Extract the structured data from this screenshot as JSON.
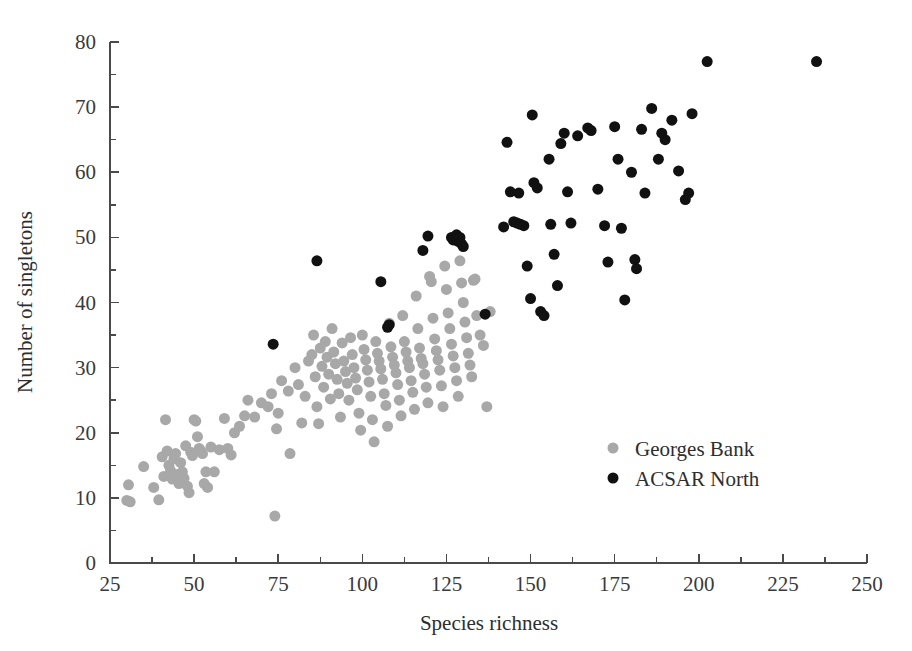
{
  "chart_data": {
    "type": "scatter",
    "title": "",
    "xlabel": "Species richness",
    "ylabel": "Number of singletons",
    "xlim": [
      25,
      250
    ],
    "ylim": [
      0,
      80
    ],
    "xticks": [
      25,
      50,
      75,
      100,
      125,
      150,
      175,
      200,
      225,
      250
    ],
    "xticklabels": [
      "25",
      "50",
      "75",
      "100",
      "125",
      "150",
      "175",
      "200",
      "225",
      "250"
    ],
    "yticks": [
      0,
      10,
      20,
      30,
      40,
      50,
      60,
      70,
      80
    ],
    "yticklabels": [
      "0",
      "10",
      "20",
      "30",
      "40",
      "50",
      "60",
      "70",
      "80"
    ],
    "x_minor_step": 12.5,
    "y_minor_step": 5,
    "grid": false,
    "legend_position": "center-right",
    "marker_size_px": 11,
    "series": [
      {
        "name": "Georges Bank",
        "color": "#a8a8a8",
        "points": [
          [
            30.5,
            12.0
          ],
          [
            30.0,
            9.6
          ],
          [
            31.0,
            9.4
          ],
          [
            35.0,
            14.8
          ],
          [
            38.0,
            11.6
          ],
          [
            39.5,
            9.7
          ],
          [
            40.5,
            16.3
          ],
          [
            41.0,
            13.3
          ],
          [
            41.5,
            22.0
          ],
          [
            42.0,
            17.2
          ],
          [
            42.5,
            15.0
          ],
          [
            43.0,
            14.2
          ],
          [
            43.5,
            12.9
          ],
          [
            44.0,
            16.0
          ],
          [
            44.5,
            16.8
          ],
          [
            45.0,
            13.6
          ],
          [
            45.5,
            12.2
          ],
          [
            46.0,
            15.4
          ],
          [
            46.5,
            14.0
          ],
          [
            47.0,
            13.0
          ],
          [
            47.5,
            18.0
          ],
          [
            48.0,
            11.8
          ],
          [
            48.5,
            10.8
          ],
          [
            49.0,
            17.0
          ],
          [
            49.5,
            16.5
          ],
          [
            50.0,
            22.0
          ],
          [
            50.5,
            21.8
          ],
          [
            51.0,
            19.4
          ],
          [
            51.5,
            17.6
          ],
          [
            52.0,
            17.2
          ],
          [
            52.5,
            16.8
          ],
          [
            53.0,
            12.2
          ],
          [
            53.5,
            14.0
          ],
          [
            54.0,
            11.6
          ],
          [
            55.0,
            17.8
          ],
          [
            56.0,
            14.0
          ],
          [
            57.5,
            17.4
          ],
          [
            59.0,
            22.2
          ],
          [
            60.0,
            17.6
          ],
          [
            61.0,
            16.6
          ],
          [
            62.0,
            20.0
          ],
          [
            63.5,
            21.0
          ],
          [
            65.0,
            22.6
          ],
          [
            66.0,
            25.0
          ],
          [
            68.0,
            22.4
          ],
          [
            70.0,
            24.6
          ],
          [
            72.0,
            24.0
          ],
          [
            73.0,
            26.0
          ],
          [
            74.0,
            7.2
          ],
          [
            74.5,
            20.6
          ],
          [
            75.0,
            23.0
          ],
          [
            76.0,
            28.0
          ],
          [
            78.0,
            26.4
          ],
          [
            78.5,
            16.8
          ],
          [
            80.0,
            30.0
          ],
          [
            81.0,
            27.4
          ],
          [
            82.0,
            21.5
          ],
          [
            83.0,
            25.6
          ],
          [
            84.0,
            31.0
          ],
          [
            85.0,
            32.0
          ],
          [
            85.5,
            35.0
          ],
          [
            86.0,
            28.6
          ],
          [
            86.5,
            24.0
          ],
          [
            87.0,
            21.4
          ],
          [
            87.5,
            33.0
          ],
          [
            88.0,
            30.2
          ],
          [
            88.5,
            27.0
          ],
          [
            89.0,
            34.0
          ],
          [
            89.5,
            31.6
          ],
          [
            90.0,
            29.0
          ],
          [
            90.5,
            25.2
          ],
          [
            91.0,
            36.0
          ],
          [
            91.5,
            32.4
          ],
          [
            92.0,
            30.6
          ],
          [
            92.5,
            28.2
          ],
          [
            93.0,
            26.0
          ],
          [
            93.5,
            22.4
          ],
          [
            94.0,
            33.8
          ],
          [
            94.5,
            31.0
          ],
          [
            95.0,
            29.4
          ],
          [
            95.5,
            27.6
          ],
          [
            96.0,
            25.0
          ],
          [
            96.5,
            34.6
          ],
          [
            97.0,
            32.0
          ],
          [
            97.5,
            30.0
          ],
          [
            98.0,
            28.4
          ],
          [
            98.5,
            26.6
          ],
          [
            99.0,
            23.0
          ],
          [
            99.5,
            20.4
          ],
          [
            100.0,
            35.0
          ],
          [
            100.5,
            32.8
          ],
          [
            101.0,
            31.2
          ],
          [
            101.5,
            29.6
          ],
          [
            102.0,
            27.8
          ],
          [
            102.5,
            25.6
          ],
          [
            103.0,
            22.0
          ],
          [
            103.5,
            18.6
          ],
          [
            104.0,
            34.0
          ],
          [
            104.5,
            32.2
          ],
          [
            105.0,
            31.0
          ],
          [
            105.5,
            29.8
          ],
          [
            106.0,
            28.2
          ],
          [
            106.5,
            26.0
          ],
          [
            107.0,
            24.2
          ],
          [
            107.5,
            21.0
          ],
          [
            108.0,
            36.8
          ],
          [
            108.5,
            33.2
          ],
          [
            109.0,
            31.6
          ],
          [
            109.5,
            30.4
          ],
          [
            110.0,
            29.2
          ],
          [
            110.5,
            27.4
          ],
          [
            111.0,
            25.0
          ],
          [
            111.5,
            22.6
          ],
          [
            112.0,
            38.0
          ],
          [
            112.5,
            34.0
          ],
          [
            113.0,
            32.4
          ],
          [
            113.5,
            31.0
          ],
          [
            114.0,
            30.0
          ],
          [
            114.5,
            28.0
          ],
          [
            115.0,
            26.2
          ],
          [
            115.5,
            23.6
          ],
          [
            116.0,
            41.0
          ],
          [
            116.5,
            36.0
          ],
          [
            117.0,
            33.0
          ],
          [
            117.5,
            31.4
          ],
          [
            118.0,
            30.6
          ],
          [
            118.5,
            29.0
          ],
          [
            119.0,
            27.0
          ],
          [
            119.5,
            24.6
          ],
          [
            120.0,
            44.0
          ],
          [
            120.5,
            43.2
          ],
          [
            121.0,
            37.6
          ],
          [
            121.5,
            34.4
          ],
          [
            122.0,
            32.6
          ],
          [
            122.5,
            31.2
          ],
          [
            123.0,
            29.6
          ],
          [
            123.5,
            27.2
          ],
          [
            124.0,
            24.0
          ],
          [
            124.5,
            45.6
          ],
          [
            125.0,
            42.0
          ],
          [
            125.5,
            38.4
          ],
          [
            126.0,
            36.0
          ],
          [
            126.5,
            33.6
          ],
          [
            127.0,
            31.8
          ],
          [
            127.5,
            30.0
          ],
          [
            128.0,
            28.0
          ],
          [
            128.5,
            25.6
          ],
          [
            129.0,
            46.4
          ],
          [
            129.5,
            43.0
          ],
          [
            130.0,
            40.0
          ],
          [
            130.5,
            37.0
          ],
          [
            131.0,
            34.6
          ],
          [
            131.5,
            32.2
          ],
          [
            132.0,
            30.4
          ],
          [
            132.5,
            28.6
          ],
          [
            133.0,
            43.4
          ],
          [
            133.5,
            43.6
          ],
          [
            134.0,
            38.0
          ],
          [
            135.0,
            35.0
          ],
          [
            136.0,
            33.4
          ],
          [
            137.0,
            24.0
          ],
          [
            138.0,
            38.6
          ]
        ]
      },
      {
        "name": "ACSAR North",
        "color": "#111111",
        "points": [
          [
            73.5,
            33.6
          ],
          [
            86.5,
            46.4
          ],
          [
            105.5,
            43.2
          ],
          [
            107.5,
            36.2
          ],
          [
            108.0,
            36.6
          ],
          [
            118.0,
            48.0
          ],
          [
            119.5,
            50.2
          ],
          [
            126.5,
            50.0
          ],
          [
            127.0,
            49.6
          ],
          [
            128.0,
            50.4
          ],
          [
            128.5,
            49.4
          ],
          [
            129.0,
            50.0
          ],
          [
            129.5,
            49.0
          ],
          [
            130.0,
            48.6
          ],
          [
            136.5,
            38.2
          ],
          [
            142.0,
            51.6
          ],
          [
            143.0,
            64.6
          ],
          [
            144.0,
            57.0
          ],
          [
            145.0,
            52.4
          ],
          [
            146.0,
            52.2
          ],
          [
            146.5,
            56.8
          ],
          [
            147.0,
            52.0
          ],
          [
            148.0,
            51.8
          ],
          [
            149.0,
            45.6
          ],
          [
            150.0,
            40.6
          ],
          [
            150.5,
            68.8
          ],
          [
            151.0,
            58.4
          ],
          [
            152.0,
            57.6
          ],
          [
            153.0,
            38.6
          ],
          [
            154.0,
            38.0
          ],
          [
            155.5,
            62.0
          ],
          [
            156.0,
            52.0
          ],
          [
            157.0,
            47.4
          ],
          [
            158.0,
            42.6
          ],
          [
            159.0,
            64.4
          ],
          [
            160.0,
            66.0
          ],
          [
            161.0,
            57.0
          ],
          [
            162.0,
            52.2
          ],
          [
            164.0,
            65.6
          ],
          [
            167.0,
            66.8
          ],
          [
            168.0,
            66.4
          ],
          [
            170.0,
            57.4
          ],
          [
            172.0,
            51.8
          ],
          [
            173.0,
            46.2
          ],
          [
            175.0,
            67.0
          ],
          [
            176.0,
            62.0
          ],
          [
            177.0,
            51.4
          ],
          [
            178.0,
            40.4
          ],
          [
            180.0,
            60.0
          ],
          [
            181.0,
            46.6
          ],
          [
            181.5,
            45.2
          ],
          [
            183.0,
            66.6
          ],
          [
            184.0,
            56.8
          ],
          [
            186.0,
            69.8
          ],
          [
            188.0,
            62.0
          ],
          [
            189.0,
            66.0
          ],
          [
            190.0,
            65.0
          ],
          [
            192.0,
            68.0
          ],
          [
            194.0,
            60.2
          ],
          [
            196.0,
            55.8
          ],
          [
            197.0,
            56.8
          ],
          [
            198.0,
            69.0
          ],
          [
            202.5,
            77.0
          ],
          [
            235.0,
            77.0
          ]
        ]
      }
    ]
  },
  "legend": {
    "items": [
      {
        "label": "Georges Bank",
        "marker": "gray-dot"
      },
      {
        "label": "ACSAR North",
        "marker": "black-dot"
      }
    ]
  },
  "colors": {
    "georges_bank": "#a8a8a8",
    "acsar_north": "#111111",
    "axis": "#4a4a4a",
    "text": "#2e2e2e",
    "background": "#ffffff"
  }
}
